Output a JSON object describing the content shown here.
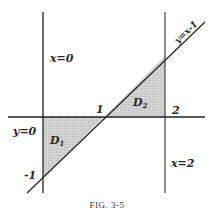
{
  "figure": {
    "caption": "Fig. 3-5",
    "caption_display": "FIG. 3-5"
  },
  "lines": {
    "x0": {
      "label": "x=0"
    },
    "x2": {
      "label": "x=2"
    },
    "y0": {
      "label": "y=0"
    },
    "diag": {
      "label": "y=x-1"
    }
  },
  "regions": {
    "D1": {
      "label": "D",
      "sub": "1",
      "fill": "#cfcfcf"
    },
    "D2": {
      "label": "D",
      "sub": "2",
      "fill": "#cfcfcf"
    }
  },
  "ticks": {
    "one": "1",
    "two": "2",
    "minus_one": "-1"
  },
  "colors": {
    "line": "#222222",
    "shade": "#cfcfcf",
    "background": "#ffffff"
  }
}
